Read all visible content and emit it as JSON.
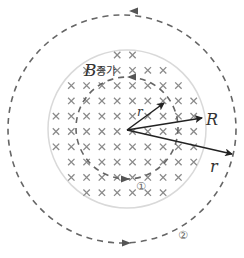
{
  "diagram": {
    "field_label_symbol": "B",
    "field_label_text": "증가",
    "inner_radius_label": "r",
    "region_radius_label": "R",
    "outer_radius_label": "r",
    "path_1_label": "①",
    "path_2_label": "②",
    "field_direction": "into-page",
    "colors": {
      "region_fill": "#ffffff",
      "region_edge": "#d9d9d9",
      "cross": "#8a8a8a",
      "dashed_path": "#666666",
      "arrow": "#222222"
    }
  }
}
